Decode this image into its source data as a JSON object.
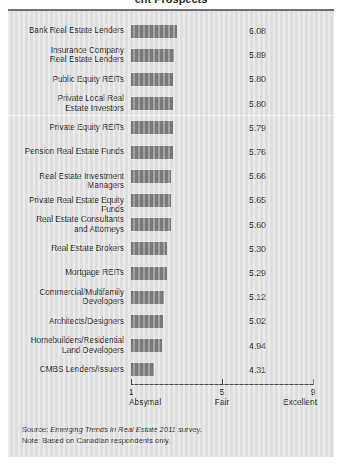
{
  "title_fragment": "ent Prospects",
  "chart_data": {
    "type": "bar",
    "title": "",
    "xlabel": "",
    "ylabel": "",
    "orientation": "horizontal",
    "xlim": [
      1,
      9
    ],
    "grid": false,
    "legend": null,
    "axis_ticks": [
      {
        "value": 1,
        "number": "1",
        "label": "Absymal"
      },
      {
        "value": 5,
        "number": "5",
        "label": "Fair"
      },
      {
        "value": 9,
        "number": "9",
        "label": "Excellent"
      }
    ],
    "categories": [
      "Bank Real Estate Lenders",
      "Insurance Company\nReal Estate Lenders",
      "Public Equity REITs",
      "Private Local Real\nEstate Investors",
      "Private Equity REITs",
      "Pension Real Estate Funds",
      "Real Estate Investment Managers",
      "Private Real Estate Equity Funds",
      "Real Estate Consultants\nand Attorneys",
      "Real Estate Brokers",
      "Mortgage REITs",
      "Commercial/Multifamily\nDevelopers",
      "Architects/Designers",
      "Homebuilders/Residential\nLand Developers",
      "CMBS Lenders/Issuers"
    ],
    "values": [
      6.08,
      5.89,
      5.8,
      5.8,
      5.79,
      5.76,
      5.66,
      5.65,
      5.6,
      5.3,
      5.29,
      5.12,
      5.02,
      4.94,
      4.31
    ],
    "value_labels": [
      "6.08",
      "5.89",
      "5.80",
      "5.80",
      "5.79",
      "5.76",
      "5.66",
      "5.65",
      "5.60",
      "5.30",
      "5.29",
      "5.12",
      "5.02",
      "4.94",
      "4.31"
    ],
    "divider_after_index": 3,
    "bar_color": "#7b7b7b",
    "panel_color": "#e2e2e2",
    "axis_color": "#4a4a4a",
    "text_color": "#1d1d1d"
  },
  "footer": {
    "source_prefix": "Source: ",
    "source_italic": "Emerging Trends in Real Estate 2011",
    "source_suffix": " survey.",
    "note": "Note: Based on Canadian respondents only."
  }
}
